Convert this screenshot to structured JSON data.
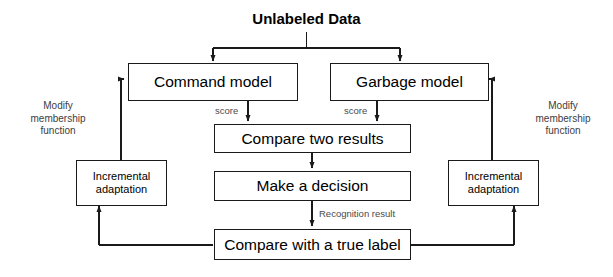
{
  "diagram": {
    "title": "Unlabeled Data",
    "boxes": [
      {
        "id": "command-model",
        "label": "Command model"
      },
      {
        "id": "garbage-model",
        "label": "Garbage model"
      },
      {
        "id": "compare-two-results",
        "label": "Compare two results"
      },
      {
        "id": "make-a-decision",
        "label": "Make a decision"
      },
      {
        "id": "compare-true-label",
        "label": "Compare with a true label"
      },
      {
        "id": "incremental-adaptation-left",
        "label": "Incremental\nadaptation"
      },
      {
        "id": "incremental-adaptation-right",
        "label": "Incremental\nadaptation"
      }
    ],
    "edge_labels": {
      "score_left": "score",
      "score_right": "score",
      "recognition_result": "Recognition result"
    },
    "side_labels": {
      "left": "Modify\nmembership\nfunction",
      "right": "Modify\nmembership\nfunction"
    },
    "colors": {
      "stroke": "#1a1a1a",
      "background": "#ffffff",
      "text": "#000000",
      "muted_text": "#4a4a4a"
    }
  }
}
